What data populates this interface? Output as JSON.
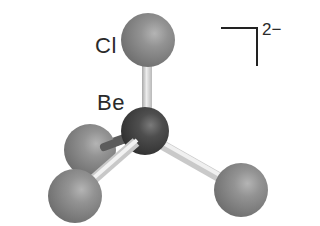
{
  "diagram": {
    "labels": {
      "chlorine": "Cl",
      "beryllium": "Be"
    },
    "charge": "2−",
    "colors": {
      "chlorine_atom": "#8a8a8a",
      "beryllium_atom": "#4a4a4a",
      "bond": "#d8d8d8",
      "hidden_bond": "#5a5a5a",
      "text": "#2a2a2a",
      "background": "#ffffff"
    },
    "atoms": [
      {
        "id": "cl-top",
        "element": "Cl",
        "cx": 148,
        "cy": 40,
        "r": 27
      },
      {
        "id": "be-center",
        "element": "Be",
        "cx": 145,
        "cy": 131,
        "r": 24
      },
      {
        "id": "cl-back-left",
        "element": "Cl",
        "cx": 90,
        "cy": 150,
        "r": 26
      },
      {
        "id": "cl-front-left",
        "element": "Cl",
        "cx": 75,
        "cy": 196,
        "r": 27
      },
      {
        "id": "cl-right",
        "element": "Cl",
        "cx": 241,
        "cy": 190,
        "r": 27
      }
    ],
    "bonds": [
      {
        "from": "be-center",
        "to": "cl-top"
      },
      {
        "from": "be-center",
        "to": "cl-back-left"
      },
      {
        "from": "be-center",
        "to": "cl-front-left"
      },
      {
        "from": "be-center",
        "to": "cl-right"
      }
    ]
  }
}
